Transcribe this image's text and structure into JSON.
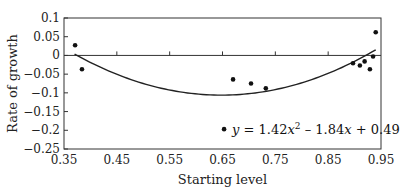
{
  "chart_data": {
    "type": "scatter",
    "title": "",
    "xlabel": "Starting level",
    "ylabel": "Rate of growth",
    "xlim": [
      0.35,
      0.95
    ],
    "ylim": [
      -0.25,
      0.1
    ],
    "x_ticks": [
      "0.35",
      "0.45",
      "0.55",
      "0.65",
      "0.75",
      "0.85",
      "0.95"
    ],
    "y_ticks": [
      "0.1",
      "0.05",
      "0",
      "−0.05",
      "−0.1",
      "−0.15",
      "−0.2",
      "−0.25"
    ],
    "grid": false,
    "legend": null,
    "series": [
      {
        "name": "observations",
        "type": "scatter",
        "points": [
          {
            "x": 0.371,
            "y": 0.027
          },
          {
            "x": 0.384,
            "y": -0.037
          },
          {
            "x": 0.653,
            "y": -0.197
          },
          {
            "x": 0.67,
            "y": -0.064
          },
          {
            "x": 0.704,
            "y": -0.075
          },
          {
            "x": 0.732,
            "y": -0.088
          },
          {
            "x": 0.897,
            "y": -0.021
          },
          {
            "x": 0.91,
            "y": -0.027
          },
          {
            "x": 0.919,
            "y": -0.016
          },
          {
            "x": 0.929,
            "y": -0.037
          },
          {
            "x": 0.935,
            "y": -0.003
          },
          {
            "x": 0.94,
            "y": 0.062
          }
        ]
      },
      {
        "name": "quadratic fit",
        "type": "line",
        "coefficients": {
          "a": 1.42,
          "b": -1.84,
          "c": 0.49
        },
        "x_range": [
          0.37,
          0.94
        ]
      }
    ],
    "annotations": [
      {
        "text_parts": [
          "y",
          " = 1.42",
          "x",
          "2",
          " – 1.84",
          "x",
          " + 0.49"
        ],
        "position": "lower right inside plot"
      }
    ]
  }
}
